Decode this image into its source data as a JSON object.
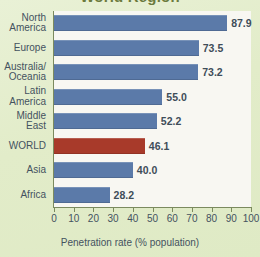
{
  "chart_data": {
    "type": "bar",
    "orientation": "horizontal",
    "title": "World Region",
    "xlabel": "Penetration rate (% population)",
    "ylabel": "",
    "xlim": [
      0,
      100
    ],
    "xticks": [
      0,
      10,
      20,
      30,
      40,
      50,
      60,
      70,
      80,
      90,
      100
    ],
    "grid": false,
    "legend": "none",
    "categories": [
      "North\nAmerica",
      "Europe",
      "Australia/\nOceania",
      "Latin\nAmerica",
      "Middle\nEast",
      "WORLD",
      "Asia",
      "Africa"
    ],
    "values": [
      87.9,
      73.5,
      73.2,
      55.0,
      52.2,
      46.1,
      40.0,
      28.2
    ],
    "value_labels": [
      "87.9",
      "73.5",
      "73.2",
      "55.0",
      "52.2",
      "46.1",
      "40.0",
      "28.2"
    ],
    "bar_colors": [
      "#5b7aa9",
      "#5b7aa9",
      "#5b7aa9",
      "#5b7aa9",
      "#5b7aa9",
      "#a83a2a",
      "#5b7aa9",
      "#5b7aa9"
    ],
    "highlight_category": "WORLD",
    "colors": {
      "bar_default": "#5b7aa9",
      "bar_highlight": "#a83a2a",
      "page_background": "#e4eecd",
      "plot_background": "#f8f7f2",
      "axis": "#7b8a5e",
      "text": "#44525f",
      "title": "#6b7a3c"
    }
  }
}
